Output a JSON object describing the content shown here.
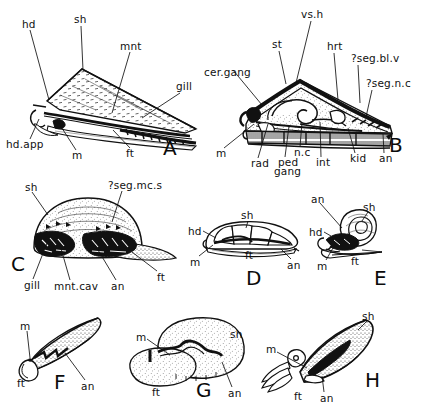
{
  "figure": {
    "background_color": "#ffffff",
    "ink_color": "#111111",
    "panel_count": 8
  },
  "abbreviations": {
    "hd": "head",
    "sh": "shell",
    "mnt": "mantle",
    "gill": "gill",
    "hd.app": "head appendage",
    "m": "mouth",
    "ft": "foot",
    "an": "anus",
    "cer.gang": "cerebral ganglion",
    "st": "stomach",
    "vs.h": "visceral hump",
    "hrt": "heart",
    "?seg.bl.v": "segmental blood vessel",
    "?seg.n.c": "segmental nerve cord",
    "rad": "radula",
    "ped.gang": "pedal ganglion",
    "n.c": "nerve cord",
    "int": "intestine",
    "kid": "kidney",
    "?seg.mc.s": "segmental muscle scars",
    "mnt.cav": "mantle cavity"
  },
  "panels": [
    {
      "letter": "A",
      "letter_x": 163,
      "letter_y": 136,
      "view": "lateral-external",
      "labels": [
        {
          "text": "hd",
          "x": 22,
          "y": 24,
          "anchor_x": 49,
          "anchor_y": 100
        },
        {
          "text": "sh",
          "x": 74,
          "y": 19,
          "anchor_x": 83,
          "anchor_y": 70
        },
        {
          "text": "mnt",
          "x": 123,
          "y": 45,
          "anchor_x": 112,
          "anchor_y": 113
        },
        {
          "text": "gill",
          "x": 176,
          "y": 86,
          "anchor_x": 142,
          "anchor_y": 118
        },
        {
          "text": "hd.app",
          "x": 9,
          "y": 144,
          "anchor_x": 39,
          "anchor_y": 119
        },
        {
          "text": "m",
          "x": 72,
          "y": 155,
          "anchor_x": 58,
          "anchor_y": 122
        },
        {
          "text": "ft",
          "x": 126,
          "y": 153,
          "anchor_x": 113,
          "anchor_y": 130
        }
      ]
    },
    {
      "letter": "B",
      "letter_x": 389,
      "letter_y": 136,
      "view": "lateral-internal",
      "labels": [
        {
          "text": "vs.h",
          "x": 304,
          "y": 14,
          "anchor_x": 296,
          "anchor_y": 83
        },
        {
          "text": "st",
          "x": 273,
          "y": 44,
          "anchor_x": 286,
          "anchor_y": 84
        },
        {
          "text": "hrt",
          "x": 328,
          "y": 46,
          "anchor_x": 338,
          "anchor_y": 100
        },
        {
          "text": "cer.gang",
          "x": 208,
          "y": 72,
          "anchor_x": 262,
          "anchor_y": 105
        },
        {
          "text": "?seg.bl.v",
          "x": 353,
          "y": 58,
          "anchor_x": 360,
          "anchor_y": 103
        },
        {
          "text": "?seg.n.c",
          "x": 368,
          "y": 83,
          "anchor_x": 366,
          "anchor_y": 117
        },
        {
          "text": "m",
          "x": 217,
          "y": 153,
          "anchor_x": 254,
          "anchor_y": 124
        },
        {
          "text": "rad",
          "x": 253,
          "y": 163,
          "anchor_x": 268,
          "anchor_y": 124
        },
        {
          "text": "ped",
          "x": 279,
          "y": 162,
          "anchor_x": 289,
          "anchor_y": 126
        },
        {
          "text": "gang",
          "x": 276,
          "y": 171,
          "anchor_x": 0,
          "anchor_y": 0
        },
        {
          "text": "n.c",
          "x": 296,
          "y": 152,
          "anchor_x": 302,
          "anchor_y": 122
        },
        {
          "text": "int",
          "x": 317,
          "y": 162,
          "anchor_x": 320,
          "anchor_y": 122
        },
        {
          "text": "kid",
          "x": 352,
          "y": 158,
          "anchor_x": 348,
          "anchor_y": 128
        },
        {
          "text": "an",
          "x": 380,
          "y": 158,
          "anchor_x": 383,
          "anchor_y": 132
        }
      ]
    },
    {
      "letter": "C",
      "letter_x": 13,
      "letter_y": 258,
      "view": "ventral",
      "labels": [
        {
          "text": "sh",
          "x": 25,
          "y": 186,
          "anchor_x": 48,
          "anchor_y": 215
        },
        {
          "text": "?seg.mc.s",
          "x": 110,
          "y": 184,
          "anchor_x": 112,
          "anchor_y": 222
        },
        {
          "text": "gill",
          "x": 27,
          "y": 284,
          "anchor_x": 47,
          "anchor_y": 243
        },
        {
          "text": "mnt.cav",
          "x": 57,
          "y": 285,
          "anchor_x": 60,
          "anchor_y": 245
        },
        {
          "text": "an",
          "x": 112,
          "y": 285,
          "anchor_x": 95,
          "anchor_y": 245
        },
        {
          "text": "ft",
          "x": 157,
          "y": 276,
          "anchor_x": 132,
          "anchor_y": 252
        }
      ]
    },
    {
      "letter": "D",
      "letter_x": 250,
      "letter_y": 270,
      "view": "lateral",
      "labels": [
        {
          "text": "hd",
          "x": 190,
          "y": 230,
          "anchor_x": 216,
          "anchor_y": 238
        },
        {
          "text": "sh",
          "x": 243,
          "y": 214,
          "anchor_x": 246,
          "anchor_y": 226
        },
        {
          "text": "m",
          "x": 192,
          "y": 261,
          "anchor_x": 213,
          "anchor_y": 245
        },
        {
          "text": "ft",
          "x": 247,
          "y": 254,
          "anchor_x": 0,
          "anchor_y": 0
        },
        {
          "text": "an",
          "x": 287,
          "y": 264,
          "anchor_x": 281,
          "anchor_y": 249
        }
      ]
    },
    {
      "letter": "E",
      "letter_x": 376,
      "letter_y": 270,
      "view": "lateral-coiled",
      "labels": [
        {
          "text": "an",
          "x": 312,
          "y": 198,
          "anchor_x": 342,
          "anchor_y": 228
        },
        {
          "text": "sh",
          "x": 364,
          "y": 206,
          "anchor_x": 362,
          "anchor_y": 221
        },
        {
          "text": "hd",
          "x": 311,
          "y": 231,
          "anchor_x": 331,
          "anchor_y": 236
        },
        {
          "text": "ft",
          "x": 352,
          "y": 260,
          "anchor_x": 0,
          "anchor_y": 0
        },
        {
          "text": "m",
          "x": 318,
          "y": 265,
          "anchor_x": 333,
          "anchor_y": 248
        }
      ]
    },
    {
      "letter": "F",
      "letter_x": 56,
      "letter_y": 380,
      "view": "lateral-elongate",
      "labels": [
        {
          "text": "m",
          "x": 21,
          "y": 325,
          "anchor_x": 30,
          "anchor_y": 358
        },
        {
          "text": "ft",
          "x": 19,
          "y": 382,
          "anchor_x": 0,
          "anchor_y": 0
        },
        {
          "text": "an",
          "x": 81,
          "y": 385,
          "anchor_x": 65,
          "anchor_y": 353
        }
      ]
    },
    {
      "letter": "G",
      "letter_x": 200,
      "letter_y": 388,
      "view": "lateral-rounded",
      "labels": [
        {
          "text": "m",
          "x": 137,
          "y": 336,
          "anchor_x": 170,
          "anchor_y": 355
        },
        {
          "text": "sh",
          "x": 231,
          "y": 333,
          "anchor_x": 0,
          "anchor_y": 0
        },
        {
          "text": "ft",
          "x": 154,
          "y": 391,
          "anchor_x": 0,
          "anchor_y": 0
        },
        {
          "text": "an",
          "x": 229,
          "y": 392,
          "anchor_x": 222,
          "anchor_y": 362
        }
      ]
    },
    {
      "letter": "H",
      "letter_x": 367,
      "letter_y": 385,
      "view": "lateral-squid-like",
      "labels": [
        {
          "text": "sh",
          "x": 364,
          "y": 315,
          "anchor_x": 358,
          "anchor_y": 330
        },
        {
          "text": "m",
          "x": 268,
          "y": 348,
          "anchor_x": 307,
          "anchor_y": 368
        },
        {
          "text": "ft",
          "x": 296,
          "y": 395,
          "anchor_x": 0,
          "anchor_y": 0
        },
        {
          "text": "an",
          "x": 321,
          "y": 397,
          "anchor_x": 322,
          "anchor_y": 376
        }
      ]
    }
  ]
}
